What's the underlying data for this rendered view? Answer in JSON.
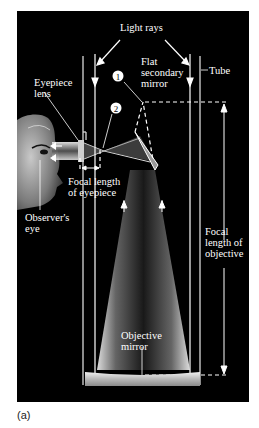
{
  "figure": {
    "caption": "(a)",
    "background_color": "#000000",
    "line_color": "#ffffff",
    "labels": {
      "light_rays": "Light rays",
      "flat_secondary_mirror": [
        "Flat",
        "secondary",
        "mirror"
      ],
      "tube": "Tube",
      "eyepiece_lens": [
        "Eyepiece",
        "lens"
      ],
      "focal_length_eyepiece": [
        "Focal length",
        "of eyepiece"
      ],
      "observers_eye": [
        "Observer's",
        "eye"
      ],
      "focal_length_objective": [
        "Focal",
        "length of",
        "objective"
      ],
      "objective_mirror": [
        "Objective",
        "mirror"
      ]
    },
    "markers": [
      {
        "number": "1"
      },
      {
        "number": "2"
      }
    ],
    "icons": {
      "observer_face": "face-profile-icon"
    }
  }
}
